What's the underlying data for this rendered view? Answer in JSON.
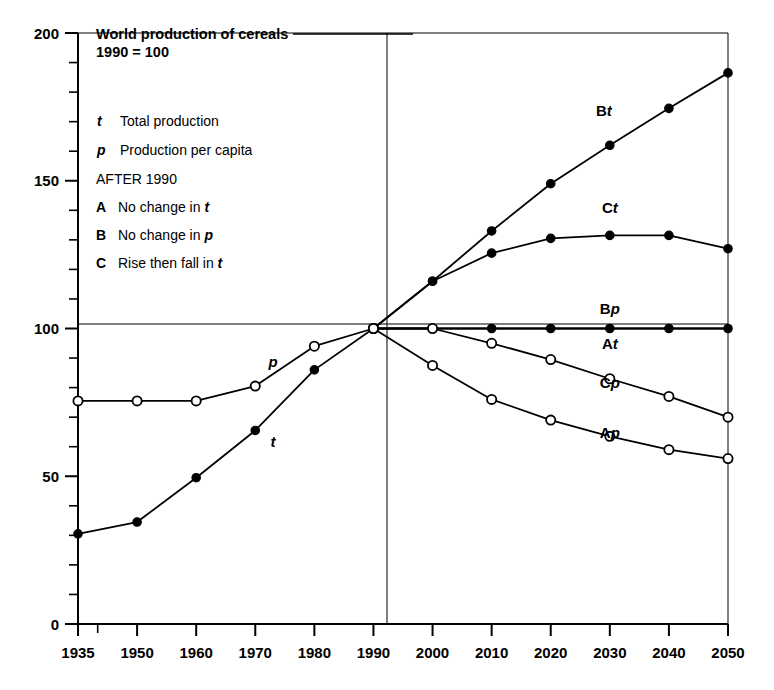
{
  "chart_data": {
    "type": "line",
    "title": "World production of cereals",
    "subtitle": "1990 = 100",
    "xlabel": "",
    "ylabel": "",
    "xlim": [
      1935,
      2050
    ],
    "ylim": [
      0,
      200
    ],
    "grid": "reference lines at y=100 and x=1990",
    "legend_position": "upper-left inside plot",
    "y_ticks_major": [
      0,
      50,
      100,
      150,
      200
    ],
    "y_ticks_minor_step": 10,
    "x_ticks": [
      1935,
      1950,
      1960,
      1970,
      1980,
      1990,
      2000,
      2010,
      2020,
      2030,
      2040,
      2050
    ],
    "x_tick_labels": [
      "1935",
      "1950",
      "1960",
      "1970",
      "1980",
      "1990",
      "2000",
      "2010",
      "2020",
      "2030",
      "2040",
      "2050"
    ],
    "y_tick_labels": [
      "0",
      "50",
      "100",
      "150",
      "200"
    ],
    "reference_year": 1990,
    "reference_value": 100,
    "series": [
      {
        "name": "t",
        "label": "t",
        "label_style": "italic",
        "marker": "filled-circle",
        "period": "historical",
        "x": [
          1935,
          1950,
          1960,
          1970,
          1980,
          1990
        ],
        "values": [
          30.5,
          34.5,
          49.5,
          65.5,
          86.0,
          100.0
        ],
        "label_x": 1973,
        "label_y": 60
      },
      {
        "name": "p",
        "label": "p",
        "label_style": "italic",
        "marker": "open-circle",
        "period": "historical",
        "x": [
          1935,
          1950,
          1960,
          1970,
          1980,
          1990
        ],
        "values": [
          75.5,
          75.5,
          75.5,
          80.5,
          94.0,
          100.0
        ],
        "label_x": 1973,
        "label_y": 87
      },
      {
        "name": "Bt",
        "label": "Bt",
        "label_style": "bold-italic-suffix",
        "marker": "filled-circle",
        "period": "projection",
        "x": [
          1990,
          2000,
          2010,
          2020,
          2030,
          2040,
          2050
        ],
        "values": [
          100.0,
          116.0,
          133.0,
          149.0,
          162.0,
          174.5,
          186.5
        ],
        "label_x": 2029,
        "label_y": 172
      },
      {
        "name": "Ct",
        "label": "Ct",
        "label_style": "bold-italic-suffix",
        "marker": "filled-circle",
        "period": "projection",
        "x": [
          1990,
          2000,
          2010,
          2020,
          2030,
          2040,
          2050
        ],
        "values": [
          100.0,
          116.0,
          125.5,
          130.5,
          131.5,
          131.5,
          127.0
        ],
        "label_x": 2030,
        "label_y": 139
      },
      {
        "name": "Bp",
        "label": "Bp",
        "label_style": "bold-italic-suffix",
        "marker": "filled-circle",
        "period": "projection",
        "x": [
          1990,
          2000,
          2010,
          2020,
          2030,
          2040,
          2050
        ],
        "values": [
          100.0,
          100.0,
          100.0,
          100.0,
          100.0,
          100.0,
          100.0
        ],
        "label_x": 2030,
        "label_y": 105
      },
      {
        "name": "At",
        "label": "At",
        "label_style": "bold-italic-suffix",
        "marker": "none",
        "period": "projection",
        "x": [
          1990,
          2050
        ],
        "values": [
          100.0,
          100.0
        ],
        "label_x": 2030,
        "label_y": 93
      },
      {
        "name": "Cp",
        "label": "Cp",
        "label_style": "bold-italic-suffix",
        "marker": "open-circle",
        "period": "projection",
        "x": [
          1990,
          2000,
          2010,
          2020,
          2030,
          2040,
          2050
        ],
        "values": [
          100.0,
          100.0,
          95.0,
          89.5,
          83.0,
          77.0,
          70.0
        ],
        "label_x": 2030,
        "label_y": 80
      },
      {
        "name": "Ap",
        "label": "Ap",
        "label_style": "bold-italic-suffix",
        "marker": "open-circle",
        "period": "projection",
        "x": [
          1990,
          2000,
          2010,
          2020,
          2030,
          2040,
          2050
        ],
        "values": [
          100.0,
          87.5,
          76.0,
          69.0,
          63.5,
          59.0,
          56.0
        ],
        "label_x": 2030,
        "label_y": 63
      }
    ]
  },
  "legend": {
    "entries": [
      {
        "key": "t",
        "key_style": "italic",
        "desc": "Total production"
      },
      {
        "key": "p",
        "key_style": "italic",
        "desc": "Production per capita"
      }
    ],
    "section_heading": "AFTER 1990",
    "scenarios": [
      {
        "key": "A",
        "desc_pre": "No change in ",
        "desc_sym": "t"
      },
      {
        "key": "B",
        "desc_pre": "No change in ",
        "desc_sym": "p"
      },
      {
        "key": "C",
        "desc_pre": "Rise then fall in ",
        "desc_sym": "t"
      }
    ]
  },
  "colors": {
    "ink": "#000000",
    "background": "#ffffff"
  }
}
